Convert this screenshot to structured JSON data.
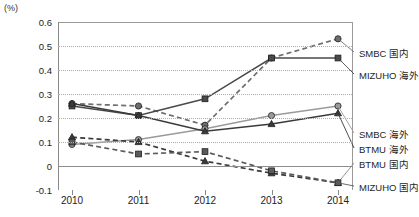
{
  "chart_data": {
    "type": "line",
    "title": "",
    "subtitle": "",
    "xlabel": "",
    "ylabel": "(%)",
    "unit_label": "(%)",
    "categories": [
      "2010",
      "2011",
      "2012",
      "2013",
      "2014"
    ],
    "x": [
      2010,
      2011,
      2012,
      2013,
      2014
    ],
    "ylim": [
      -0.1,
      0.6
    ],
    "yticks": [
      "0.6",
      "0.5",
      "0.4",
      "0.3",
      "0.2",
      "0.1",
      "0",
      "-0.1"
    ],
    "ytick_values": [
      0.6,
      0.5,
      0.4,
      0.3,
      0.2,
      0.1,
      0,
      -0.1
    ],
    "grid": true,
    "grid_style": "dotted-horizontal",
    "legend_position": "right-inline-at-line-end",
    "series": [
      {
        "name": "SMBC 国内",
        "values": [
          0.26,
          0.25,
          0.17,
          0.45,
          0.53
        ],
        "marker": "circle",
        "line_style": "dashed",
        "color": "#6e6e6e"
      },
      {
        "name": "MIZUHO 海外",
        "values": [
          0.25,
          0.21,
          0.28,
          0.45,
          0.45
        ],
        "marker": "square",
        "line_style": "solid",
        "color": "#4a4a4a"
      },
      {
        "name": "SMBC 海外",
        "values": [
          0.09,
          0.11,
          0.155,
          0.21,
          0.25
        ],
        "marker": "circle",
        "line_style": "solid",
        "color": "#9a9a9a"
      },
      {
        "name": "BTMU 海外",
        "values": [
          0.26,
          0.21,
          0.145,
          0.175,
          0.22
        ],
        "marker": "triangle",
        "line_style": "solid",
        "color": "#3a3a3a"
      },
      {
        "name": "BTMU 国内",
        "values": [
          0.12,
          0.1,
          0.02,
          -0.03,
          -0.07
        ],
        "marker": "triangle",
        "line_style": "dashed",
        "color": "#3a3a3a"
      },
      {
        "name": "MIZUHO 国内",
        "values": [
          0.1,
          0.05,
          0.06,
          -0.02,
          -0.07
        ],
        "marker": "square",
        "line_style": "dashed",
        "color": "#5a5a5a"
      }
    ]
  },
  "legend": {
    "items": [
      {
        "label": "SMBC 国内"
      },
      {
        "label": "MIZUHO 海外"
      },
      {
        "label": "SMBC 海外"
      },
      {
        "label": "BTMU 海外"
      },
      {
        "label": "BTMU 国内"
      },
      {
        "label": "MIZUHO 国内"
      }
    ]
  },
  "caption": {
    "text": ""
  }
}
